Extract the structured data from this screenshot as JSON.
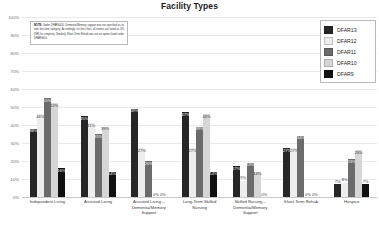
{
  "chart": {
    "title": "Facility Types"
  },
  "note": {
    "label": "NOTE:",
    "body": "Under DFAR9&10, Dementia/Memory support was not specified as its own line-item category. Accordingly, for this chart, all entries are listed as 0% (NR) for simplicity. Similarly, Short-Term Rehab was not an option listed under DFAR9&10."
  },
  "legend": {
    "position": "top-right",
    "items": [
      {
        "label": "DFAR13",
        "color": "#262626"
      },
      {
        "label": "DFAR12",
        "color": "#ededed"
      },
      {
        "label": "DFAR11",
        "color": "#6b6b6b"
      },
      {
        "label": "DFAR10",
        "color": "#d6d6d6"
      },
      {
        "label": "DFAR9",
        "color": "#111111"
      }
    ]
  },
  "chart_data": {
    "type": "bar",
    "title": "Facility Types",
    "xlabel": "",
    "ylabel": "",
    "ylim": [
      0,
      100
    ],
    "grid": true,
    "ytick_labels": [
      "100%",
      "90%",
      "80%",
      "70%",
      "60%",
      "50%",
      "40%",
      "30%",
      "20%",
      "10%",
      "0%"
    ],
    "ytick_values": [
      100,
      90,
      80,
      70,
      60,
      50,
      40,
      30,
      20,
      10,
      0
    ],
    "categories": [
      "Independent Living",
      "Assisted Living",
      "Assisted Living – Dementia/Memory Support",
      "Long-Term Skilled Nursing",
      "Skilled Nursing – Dementia/Memory Support",
      "Short-Term Rehab",
      "Hospice"
    ],
    "series": [
      {
        "name": "DFAR13",
        "color": "#262626",
        "values": [
          38,
          45,
          49,
          47,
          17,
          27,
          7
        ],
        "labels": [
          "38%",
          "45%",
          "49%",
          "47%",
          "17%",
          "27%",
          "7%"
        ]
      },
      {
        "name": "DFAR12",
        "color": "#ededed",
        "values": [
          46,
          41,
          27,
          27,
          9,
          27,
          8
        ],
        "labels": [
          "46%",
          "41%",
          "27%",
          "27%",
          "9%",
          "27%",
          "8%"
        ]
      },
      {
        "name": "DFAR11",
        "color": "#6b6b6b",
        "values": [
          55,
          35,
          20,
          39,
          19,
          34,
          21
        ],
        "labels": [
          "55%",
          "35%",
          "20%",
          "39%",
          "19%",
          "34%",
          "21%"
        ]
      },
      {
        "name": "DFAR10",
        "color": "#d6d6d6",
        "values": [
          52,
          39,
          0,
          46,
          14,
          0,
          26
        ],
        "labels": [
          "52%",
          "39%",
          "0%",
          "46%",
          "14%",
          "0%",
          "26%"
        ]
      },
      {
        "name": "DFAR9",
        "color": "#111111",
        "values": [
          16,
          14,
          0,
          14,
          0,
          0,
          7
        ],
        "labels": [
          "16%",
          "14%",
          "0%",
          "14%",
          "0%",
          "0%",
          "7%"
        ]
      }
    ]
  }
}
